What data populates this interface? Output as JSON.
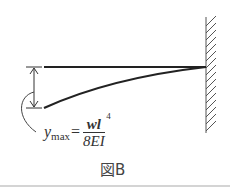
{
  "diagram": {
    "type": "cantilever-beam-deflection",
    "formula": {
      "lhs": "y",
      "lhs_subscript": "max",
      "equals": "=",
      "numerator": "wl",
      "numerator_exponent": "4",
      "denominator": "8EI"
    },
    "caption": "図B",
    "colors": {
      "line": "#2a2a2a",
      "hatch": "#666666",
      "rule": "#999999"
    }
  }
}
